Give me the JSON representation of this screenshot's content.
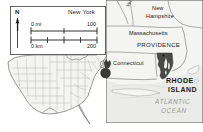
{
  "map": {
    "title": "Rhode Island locator map",
    "subject": "RHODE ISLAND",
    "colors": {
      "background": "#ffffff",
      "land_fill": "#f2f2f0",
      "water_fill": "#e9e9e7",
      "boundary_line": "#8c8c8c",
      "coast_line": "#6e6e6e",
      "focus_fill": "#4a4a4a",
      "marker_fill": "#3a3a3a",
      "text": "#1a1a1a",
      "ocean_text": "#9a9a9a",
      "frame": "#555555"
    }
  },
  "inset_panel": {
    "name": "scale-and-orientation-inset",
    "north_arrow": {
      "label": "N",
      "icon": "north-arrow-icon"
    },
    "scale_bar": {
      "miles": {
        "unit_label": "0 mi",
        "max_label": "100",
        "ticks": [
          "0",
          "50",
          "100"
        ]
      },
      "kilometers": {
        "unit_label": "0 km",
        "max_label": "200",
        "ticks": [
          "0",
          "100",
          "200"
        ]
      }
    }
  },
  "labels": {
    "new_york": "New York",
    "vermont": "Vermont",
    "new_hampshire_line1": "New",
    "new_hampshire_line2": "Hampshire",
    "massachusetts": "Massachusetts",
    "providence": "PROVIDENCE",
    "connecticut": "Connecticut",
    "rhode_island_line1": "RHODE",
    "rhode_island_line2": "ISLAND",
    "atlantic_line1": "ATLANTIC",
    "atlantic_line2": "OCEAN"
  },
  "us_inset": {
    "name": "united-states-locator-inset",
    "marker": "location-marker-icon",
    "marker_description": "Filled circle marking Rhode Island"
  }
}
